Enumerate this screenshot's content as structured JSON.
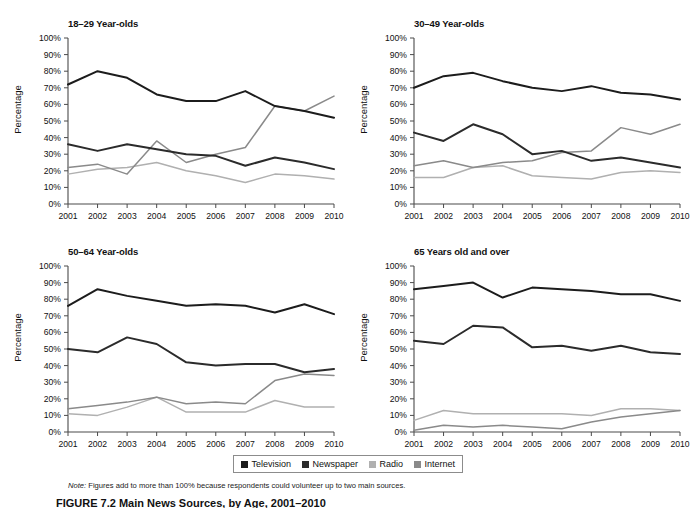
{
  "figure": {
    "note_label": "Note:",
    "note_text": " Figures add to more than 100% because respondents could volunteer up to two main sources.",
    "caption": "FIGURE 7.2  Main News Sources, by Age, 2001–2010"
  },
  "legend": {
    "position": "bottom-center",
    "items": [
      {
        "label": "Television",
        "color": "#1c1c1c"
      },
      {
        "label": "Newspaper",
        "color": "#2b2b2b"
      },
      {
        "label": "Radio",
        "color": "#b0b0b0"
      },
      {
        "label": "Internet",
        "color": "#8a8a8a"
      }
    ]
  },
  "axes": {
    "ylabel": "Percentage",
    "yticks": [
      "0%",
      "10%",
      "20%",
      "30%",
      "40%",
      "50%",
      "60%",
      "70%",
      "80%",
      "90%",
      "100%"
    ],
    "ylim": [
      0,
      100
    ],
    "xticks": [
      "2001",
      "2002",
      "2003",
      "2004",
      "2005",
      "2006",
      "2007",
      "2008",
      "2009",
      "2010"
    ],
    "grid": false
  },
  "chart_data": [
    {
      "type": "line",
      "title": "18–29 Year-olds",
      "xlabel": "",
      "ylabel": "Percentage",
      "ylim": [
        0,
        100
      ],
      "x": [
        2001,
        2002,
        2003,
        2004,
        2005,
        2006,
        2007,
        2008,
        2009,
        2010
      ],
      "categories": [
        "2001",
        "2002",
        "2003",
        "2004",
        "2005",
        "2006",
        "2007",
        "2008",
        "2009",
        "2010"
      ],
      "series": [
        {
          "name": "Television",
          "color": "#1c1c1c",
          "values": [
            72,
            80,
            76,
            66,
            62,
            62,
            68,
            59,
            56,
            52
          ]
        },
        {
          "name": "Newspaper",
          "color": "#2b2b2b",
          "values": [
            36,
            32,
            36,
            33,
            30,
            29,
            23,
            28,
            25,
            21
          ]
        },
        {
          "name": "Radio",
          "color": "#b0b0b0",
          "values": [
            18,
            21,
            22,
            25,
            20,
            17,
            13,
            18,
            17,
            15
          ]
        },
        {
          "name": "Internet",
          "color": "#8a8a8a",
          "values": [
            22,
            24,
            18,
            38,
            25,
            30,
            34,
            59,
            56,
            65
          ]
        }
      ]
    },
    {
      "type": "line",
      "title": "30–49 Year-olds",
      "xlabel": "",
      "ylabel": "Percentage",
      "ylim": [
        0,
        100
      ],
      "x": [
        2001,
        2002,
        2003,
        2004,
        2005,
        2006,
        2007,
        2008,
        2009,
        2010
      ],
      "categories": [
        "2001",
        "2002",
        "2003",
        "2004",
        "2005",
        "2006",
        "2007",
        "2008",
        "2009",
        "2010"
      ],
      "series": [
        {
          "name": "Television",
          "color": "#1c1c1c",
          "values": [
            70,
            77,
            79,
            74,
            70,
            68,
            71,
            67,
            66,
            63
          ]
        },
        {
          "name": "Newspaper",
          "color": "#2b2b2b",
          "values": [
            43,
            38,
            48,
            42,
            30,
            32,
            26,
            28,
            25,
            22
          ]
        },
        {
          "name": "Radio",
          "color": "#b0b0b0",
          "values": [
            16,
            16,
            22,
            23,
            17,
            16,
            15,
            19,
            20,
            19
          ]
        },
        {
          "name": "Internet",
          "color": "#8a8a8a",
          "values": [
            23,
            26,
            22,
            25,
            26,
            31,
            32,
            46,
            42,
            48
          ]
        }
      ]
    },
    {
      "type": "line",
      "title": "50–64 Year-olds",
      "xlabel": "",
      "ylabel": "Percentage",
      "ylim": [
        0,
        100
      ],
      "x": [
        2001,
        2002,
        2003,
        2004,
        2005,
        2006,
        2007,
        2008,
        2009,
        2010
      ],
      "categories": [
        "2001",
        "2002",
        "2003",
        "2004",
        "2005",
        "2006",
        "2007",
        "2008",
        "2009",
        "2010"
      ],
      "series": [
        {
          "name": "Television",
          "color": "#1c1c1c",
          "values": [
            76,
            86,
            82,
            79,
            76,
            77,
            76,
            72,
            77,
            71
          ]
        },
        {
          "name": "Newspaper",
          "color": "#2b2b2b",
          "values": [
            50,
            48,
            57,
            53,
            42,
            40,
            41,
            41,
            36,
            38
          ]
        },
        {
          "name": "Radio",
          "color": "#b0b0b0",
          "values": [
            11,
            10,
            15,
            21,
            12,
            12,
            12,
            19,
            15,
            15
          ]
        },
        {
          "name": "Internet",
          "color": "#8a8a8a",
          "values": [
            14,
            16,
            18,
            21,
            17,
            18,
            17,
            31,
            35,
            34
          ]
        }
      ]
    },
    {
      "type": "line",
      "title": "65 Years old and over",
      "xlabel": "",
      "ylabel": "Percentage",
      "ylim": [
        0,
        100
      ],
      "x": [
        2001,
        2002,
        2003,
        2004,
        2005,
        2006,
        2007,
        2008,
        2009,
        2010
      ],
      "categories": [
        "2001",
        "2002",
        "2003",
        "2004",
        "2005",
        "2006",
        "2007",
        "2008",
        "2009",
        "2010"
      ],
      "series": [
        {
          "name": "Television",
          "color": "#1c1c1c",
          "values": [
            86,
            88,
            90,
            81,
            87,
            86,
            85,
            83,
            83,
            79
          ]
        },
        {
          "name": "Newspaper",
          "color": "#2b2b2b",
          "values": [
            55,
            53,
            64,
            63,
            51,
            52,
            49,
            52,
            48,
            47
          ]
        },
        {
          "name": "Radio",
          "color": "#b0b0b0",
          "values": [
            7,
            13,
            11,
            11,
            11,
            11,
            10,
            14,
            14,
            13
          ]
        },
        {
          "name": "Internet",
          "color": "#8a8a8a",
          "values": [
            1,
            4,
            3,
            4,
            3,
            2,
            6,
            9,
            11,
            13
          ]
        }
      ]
    }
  ]
}
